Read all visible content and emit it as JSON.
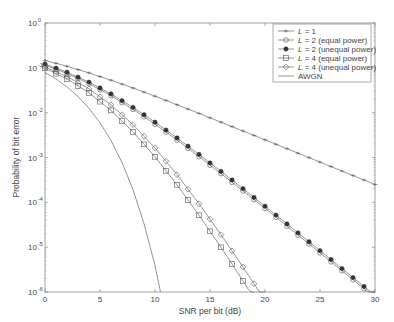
{
  "chart_data": {
    "type": "line",
    "title": "",
    "xlabel": "SNR per bit (dB)",
    "ylabel": "Probability of bit error",
    "xlim": [
      0,
      30
    ],
    "ylim": [
      1e-06,
      1
    ],
    "yscale": "log",
    "grid": false,
    "legend_position": "upper right",
    "xticks": [
      0,
      5,
      10,
      15,
      20,
      25,
      30
    ],
    "xtick_labels": [
      "0",
      "5",
      "10",
      "15",
      "20",
      "25",
      "30"
    ],
    "yticks": [
      0,
      -1,
      -2,
      -3,
      -4,
      -5,
      -6
    ],
    "ytick_labels": [
      "10",
      "10",
      "10",
      "10",
      "10",
      "10",
      "10"
    ],
    "ytick_exponents": [
      "0",
      "-1",
      "-2",
      "-3",
      "-4",
      "-5",
      "-6"
    ],
    "series": [
      {
        "name": "L = 1",
        "legend_var": "L",
        "legend_rest": " = 1",
        "marker": "x",
        "x": [
          0,
          2,
          4,
          6,
          8,
          10,
          12,
          14,
          16,
          18,
          20,
          22,
          24,
          26,
          28,
          30
        ],
        "values": [
          0.1464,
          0.1085,
          0.0771,
          0.053,
          0.0355,
          0.0233,
          0.01505,
          0.00962,
          0.00613,
          0.0039,
          0.00248,
          0.00157,
          0.000994,
          0.000628,
          0.000396,
          0.00025
        ]
      },
      {
        "name": "L = 2 (equal power)",
        "legend_var": "L",
        "legend_rest": " = 2 (equal power)",
        "marker": "circle",
        "x": [
          0,
          2,
          4,
          6,
          8,
          10,
          12,
          14,
          16,
          18,
          20,
          22,
          24,
          26,
          28,
          30
        ],
        "values": [
          0.1151,
          0.0748,
          0.0443,
          0.0239,
          0.01187,
          0.00553,
          0.00245,
          0.001046,
          0.000437,
          0.00018,
          7.33e-05,
          2.94e-05,
          1.18e-05,
          4.72e-06,
          1.88e-06,
          7.49e-07
        ]
      },
      {
        "name": "L = 2 (unequal power)",
        "legend_var": "L",
        "legend_rest": " = 2 (unequal power)",
        "marker": "filled-circle",
        "x": [
          0,
          2,
          4,
          6,
          8,
          10,
          12,
          14,
          16,
          18,
          20,
          22,
          24,
          26,
          28,
          30
        ],
        "values": [
          0.121,
          0.08,
          0.048,
          0.0262,
          0.0131,
          0.00615,
          0.00273,
          0.00117,
          0.00049,
          0.000202,
          8.2e-05,
          3.3e-05,
          1.32e-05,
          5.3e-06,
          2.1e-06,
          8.4e-07
        ]
      },
      {
        "name": "L = 4 (equal power)",
        "legend_var": "L",
        "legend_rest": " = 4 (equal power)",
        "marker": "square",
        "x": [
          0,
          2,
          4,
          6,
          8,
          10,
          12,
          14,
          16,
          18,
          19
        ],
        "values": [
          0.0975,
          0.0565,
          0.02767,
          0.01123,
          0.003735,
          0.001038,
          0.000246,
          5.15e-05,
          9.92e-06,
          1.77e-06,
          7.2e-07
        ]
      },
      {
        "name": "L = 4 (unequal power)",
        "legend_var": "L",
        "legend_rest": " = 4 (unequal power)",
        "marker": "diamond",
        "x": [
          0,
          2,
          4,
          6,
          8,
          10,
          12,
          14,
          16,
          18,
          20
        ],
        "values": [
          0.104,
          0.064,
          0.034,
          0.015,
          0.0054,
          0.00163,
          0.000415,
          9.3e-05,
          1.9e-05,
          3.6e-06,
          6.5e-07
        ]
      },
      {
        "name": "AWGN",
        "legend_var": "",
        "legend_rest": "AWGN",
        "marker": "none",
        "x": [
          0,
          1,
          2,
          3,
          4,
          5,
          6,
          7,
          8,
          9,
          10,
          10.5
        ],
        "values": [
          0.0786,
          0.0563,
          0.0375,
          0.0229,
          0.0125,
          0.00595,
          0.00239,
          0.000773,
          0.000191,
          3.36e-05,
          3.87e-06,
          1e-06
        ]
      }
    ]
  }
}
